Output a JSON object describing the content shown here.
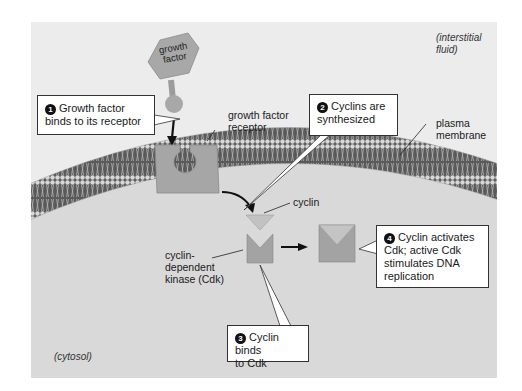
{
  "labels": {
    "growth_factor": [
      "growth",
      "factor"
    ],
    "growth_factor_receptor": [
      "growth factor",
      "receptor"
    ],
    "plasma_membrane": [
      "plasma",
      "membrane"
    ],
    "cyclin": "cyclin",
    "cdk": [
      "cyclin-",
      "dependent",
      "kinase (Cdk)"
    ],
    "interstitial_fluid": [
      "(interstitial",
      "fluid)"
    ],
    "cytosol": "(cytosol)"
  },
  "steps": [
    {
      "number": "1",
      "lines": [
        "Growth factor",
        "binds to its receptor"
      ]
    },
    {
      "number": "2",
      "lines": [
        "Cyclins are",
        "synthesized"
      ]
    },
    {
      "number": "3",
      "lines": [
        "Cyclin binds",
        "to Cdk"
      ]
    },
    {
      "number": "4",
      "lines": [
        "Cyclin activates",
        "Cdk; active Cdk",
        "stimulates DNA",
        "replication"
      ]
    }
  ],
  "colors": {
    "panel": "#e9e9e9",
    "cytosol": "#d6d6d6",
    "membrane_dark": "#4a4a4a",
    "protein": "#a6a6a6",
    "protein_light": "#c4c4c4"
  }
}
